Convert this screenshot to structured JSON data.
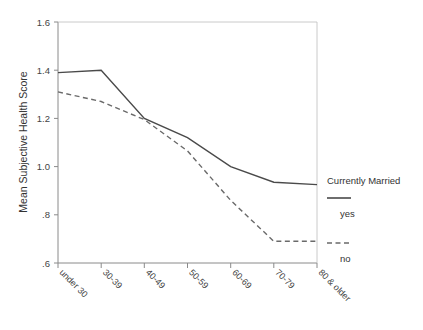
{
  "chart_data": {
    "type": "line",
    "title": "",
    "xlabel": "",
    "ylabel": "Mean Subjective Health Score",
    "categories": [
      "under 30",
      "30-39",
      "40-49",
      "50-59",
      "60-69",
      "70-79",
      "80 & older"
    ],
    "ylim": [
      0.6,
      1.6
    ],
    "ytick_labels": [
      "1.6",
      "1.4",
      "1.2",
      "1.0",
      ".8",
      ".6"
    ],
    "ytick_values": [
      1.6,
      1.4,
      1.2,
      1.0,
      0.8,
      0.6
    ],
    "grid": false,
    "legend_position": "right",
    "legend_title": "Currently Married",
    "series": [
      {
        "name": "yes",
        "style": "solid",
        "color": "#4a4a4a",
        "values": [
          1.39,
          1.4,
          1.2,
          1.12,
          1.0,
          0.935,
          0.925
        ]
      },
      {
        "name": "no",
        "style": "dashed",
        "color": "#6a6a6a",
        "values": [
          1.31,
          1.27,
          1.195,
          1.065,
          0.86,
          0.69,
          0.69
        ]
      }
    ]
  },
  "axes": {
    "y_title": "Mean Subjective Health Score",
    "y_ticks": [
      {
        "label": "1.6"
      },
      {
        "label": "1.4"
      },
      {
        "label": "1.2"
      },
      {
        "label": "1.0"
      },
      {
        "label": ".8"
      },
      {
        "label": ".6"
      }
    ],
    "x_ticks": [
      {
        "label": "under 30"
      },
      {
        "label": "30-39"
      },
      {
        "label": "40-49"
      },
      {
        "label": "50-59"
      },
      {
        "label": "60-69"
      },
      {
        "label": "70-79"
      },
      {
        "label": "80 & older"
      }
    ]
  },
  "legend": {
    "title": "Currently Married",
    "entries": [
      {
        "label": "yes",
        "style": "solid"
      },
      {
        "label": "no",
        "style": "dashed"
      }
    ]
  },
  "colors": {
    "series_yes": "#4a4a4a",
    "series_no": "#6a6a6a",
    "axis": "#8a8a8a",
    "text": "#3a3a3a",
    "background": "#ffffff"
  }
}
